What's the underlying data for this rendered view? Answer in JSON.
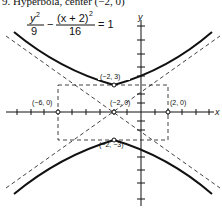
{
  "header": {
    "title": "9. Hyperbola, center (−2, 0)"
  },
  "equation": {
    "num1": "y",
    "num1_exp": "2",
    "den1": "9",
    "minus": "−",
    "num2": "(x + 2)",
    "num2_exp": "2",
    "den2": "16",
    "rhs": "= 1"
  },
  "axes": {
    "x_label": "x",
    "y_label": "y"
  },
  "points": {
    "top_vertex": "(−2, 3)",
    "center": "(−2, 0)",
    "left_point": "(−6, 0)",
    "right_point": "(2, 0)",
    "bottom_vertex": "(−2, −3)"
  },
  "colors": {
    "ink": "#111111",
    "background": "#ffffff"
  }
}
